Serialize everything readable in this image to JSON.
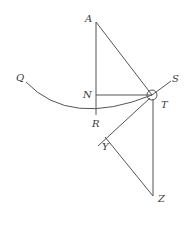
{
  "diagram": {
    "type": "geometric-construction",
    "labels": {
      "A": "A",
      "N": "N",
      "Q": "Q",
      "R": "R",
      "S": "S",
      "T": "T",
      "Y": "Y",
      "Z": "Z"
    },
    "colors": {
      "stroke": "#555555",
      "text": "#3a3a3a",
      "background": "#ffffff"
    }
  }
}
